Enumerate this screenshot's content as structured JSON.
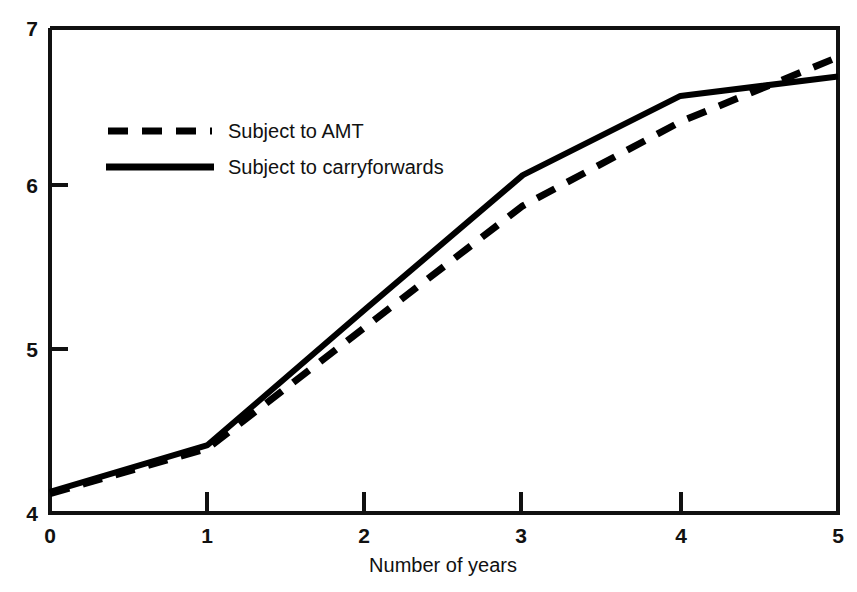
{
  "chart_data": {
    "type": "line",
    "title": "",
    "subtitle": "",
    "xlabel": "Number of years",
    "ylabel": "",
    "xlim": [
      0,
      5
    ],
    "ylim": [
      4,
      7
    ],
    "grid": false,
    "legend_position": "upper-left-inside",
    "x": [
      0,
      1,
      2,
      3,
      4,
      5
    ],
    "xticks": [
      "0",
      "1",
      "2",
      "3",
      "4",
      "5"
    ],
    "yticks": [
      "4",
      "5",
      "6",
      "7"
    ],
    "ytick_values": [
      4,
      5,
      6,
      7
    ],
    "series": [
      {
        "name": "Subject to AMT",
        "style": "dashed",
        "color": "#000000",
        "values": [
          4.12,
          4.4,
          5.15,
          5.9,
          6.42,
          6.82
        ]
      },
      {
        "name": "Subject to carryforwards",
        "style": "solid",
        "color": "#000000",
        "values": [
          4.13,
          4.42,
          5.26,
          6.09,
          6.58,
          6.7
        ]
      }
    ],
    "annotations": []
  },
  "axes": {
    "y_tick_labels": [
      "7",
      "6",
      "5",
      "4"
    ],
    "x_tick_labels": [
      "0",
      "1",
      "2",
      "3",
      "4",
      "5"
    ],
    "x_axis_title": "Number of years"
  },
  "legend": {
    "entries": [
      {
        "label": "Subject to AMT",
        "swatch": "dashed-line-swatch"
      },
      {
        "label": "Subject to carryforwards",
        "swatch": "solid-line-swatch"
      }
    ]
  },
  "colors": {
    "ink": "#000000",
    "background": "#ffffff"
  }
}
